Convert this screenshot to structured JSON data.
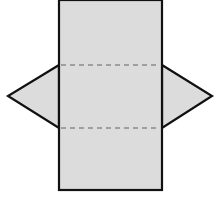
{
  "diagram": {
    "type": "triangular-prism-net",
    "colors": {
      "fill": "#dcdcdc",
      "stroke": "#111111",
      "fold_line": "#8a8a8a",
      "background": "#ffffff"
    },
    "rectangle": {
      "x": 59,
      "y": 0,
      "width": 103,
      "height": 190
    },
    "fold_lines_y": [
      65,
      128
    ],
    "left_triangle": {
      "apex": [
        8,
        96
      ],
      "top": [
        59,
        65
      ],
      "bottom": [
        59,
        128
      ]
    },
    "right_triangle": {
      "apex": [
        212,
        96
      ],
      "top": [
        162,
        65
      ],
      "bottom": [
        162,
        128
      ]
    }
  }
}
